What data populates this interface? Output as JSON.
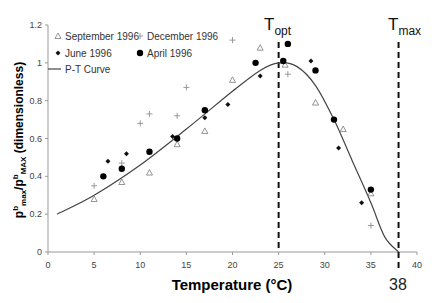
{
  "chart_data": {
    "type": "scatter",
    "title": "",
    "xlabel": "Temperature (°C)",
    "ylabel": "P^b_max/P^b_MAX (dimensionless)",
    "xlim": [
      0,
      40
    ],
    "ylim": [
      0,
      1.2
    ],
    "x_ticks": [
      "0",
      "5",
      "10",
      "15",
      "20",
      "25",
      "30",
      "35",
      "40"
    ],
    "y_ticks": [
      "0",
      "0.2",
      "0.4",
      "0.6",
      "0.8",
      "1",
      "1.2"
    ],
    "grid": false,
    "legend_position": "upper-left",
    "series": [
      {
        "name": "September 1996",
        "marker": "triangle-open",
        "color": "#888888",
        "points": [
          [
            5,
            0.28
          ],
          [
            8,
            0.37
          ],
          [
            11,
            0.42
          ],
          [
            14,
            0.57
          ],
          [
            17,
            0.64
          ],
          [
            20,
            0.91
          ],
          [
            23,
            1.08
          ],
          [
            25.7,
            0.99
          ],
          [
            29,
            0.79
          ],
          [
            32,
            0.65
          ],
          [
            35,
            0.31
          ]
        ]
      },
      {
        "name": "December 1996",
        "marker": "plus",
        "color": "#999999",
        "points": [
          [
            5,
            0.35
          ],
          [
            8,
            0.47
          ],
          [
            10,
            0.68
          ],
          [
            11,
            0.73
          ],
          [
            14,
            0.72
          ],
          [
            15,
            0.87
          ],
          [
            20,
            1.12
          ],
          [
            26,
            0.94
          ],
          [
            35,
            0.14
          ]
        ]
      },
      {
        "name": "June 1996",
        "marker": "diamond-small",
        "color": "#111111",
        "points": [
          [
            6.5,
            0.48
          ],
          [
            8.5,
            0.52
          ],
          [
            13.5,
            0.61
          ],
          [
            17,
            0.71
          ],
          [
            19.5,
            0.78
          ],
          [
            23,
            0.93
          ],
          [
            28.5,
            1.01
          ],
          [
            31.5,
            0.55
          ],
          [
            34,
            0.26
          ]
        ]
      },
      {
        "name": "April 1996",
        "marker": "circle-filled",
        "color": "#000000",
        "points": [
          [
            6,
            0.4
          ],
          [
            8,
            0.44
          ],
          [
            11,
            0.53
          ],
          [
            14,
            0.6
          ],
          [
            17,
            0.75
          ],
          [
            22.5,
            1.0
          ],
          [
            25.5,
            1.01
          ],
          [
            26,
            1.1
          ],
          [
            29,
            0.96
          ],
          [
            31,
            0.7
          ],
          [
            35,
            0.33
          ]
        ]
      },
      {
        "name": "P-T Curve",
        "marker": "line",
        "color": "#444444",
        "points": [
          [
            1,
            0.2
          ],
          [
            5,
            0.3
          ],
          [
            10,
            0.46
          ],
          [
            15,
            0.65
          ],
          [
            20,
            0.85
          ],
          [
            23,
            0.96
          ],
          [
            25,
            1.0
          ],
          [
            27,
            0.98
          ],
          [
            29,
            0.88
          ],
          [
            31,
            0.7
          ],
          [
            33,
            0.48
          ],
          [
            35,
            0.26
          ],
          [
            36.5,
            0.08
          ],
          [
            38,
            0.0
          ]
        ]
      }
    ],
    "annotations": [
      {
        "label_main": "T",
        "label_sub": "opt",
        "x": 25,
        "style": "dashed-vertical"
      },
      {
        "label_main": "T",
        "label_sub": "max",
        "x": 38,
        "style": "dashed-vertical"
      },
      {
        "label": "38",
        "x": 38,
        "position": "below-axis"
      }
    ]
  },
  "legend": {
    "items": [
      {
        "label": "September 1996"
      },
      {
        "label": "December 1996"
      },
      {
        "label": "June 1996"
      },
      {
        "label": "April 1996"
      },
      {
        "label": "P-T Curve"
      }
    ]
  },
  "axes": {
    "xlabel": "Temperature (°C)",
    "ylabel_main": "p",
    "ylabel_sup1": "b",
    "ylabel_sub1": "max",
    "ylabel_sep": "/p",
    "ylabel_sup2": "b",
    "ylabel_sub2": "MAX",
    "ylabel_tail": " (dimensionless)"
  },
  "annot": {
    "topt_main": "T",
    "topt_sub": "opt",
    "tmax_main": "T",
    "tmax_sub": "max",
    "tmax_value": "38"
  }
}
